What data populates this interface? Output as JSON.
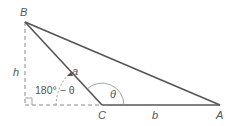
{
  "diagram": {
    "type": "triangle-altitude",
    "colors": {
      "stroke": "#555555",
      "dashed": "#8a8a8a",
      "arc": "#8a8a8a",
      "text": "#555555"
    },
    "vertices": {
      "B": {
        "label": "B",
        "x": 25,
        "y": 22
      },
      "C": {
        "label": "C",
        "x": 102,
        "y": 105
      },
      "A": {
        "label": "A",
        "x": 220,
        "y": 105
      },
      "foot": {
        "x": 25,
        "y": 105
      }
    },
    "labels": {
      "h": "h",
      "a": "a",
      "b": "b",
      "theta": "θ",
      "supplement": "180° − θ"
    }
  }
}
